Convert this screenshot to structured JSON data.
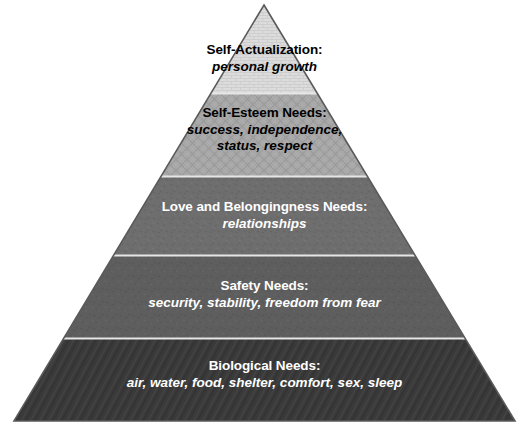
{
  "diagram": {
    "type": "pyramid",
    "name": "maslow-hierarchy-of-needs",
    "background_color": "#ffffff",
    "apex": {
      "x": 264,
      "y": 5
    },
    "base_left": {
      "x": 14,
      "y": 421
    },
    "base_right": {
      "x": 515,
      "y": 421
    },
    "divider_color": "#e8e8e8",
    "outline_color": "#555555",
    "tiers": [
      {
        "id": "self-actualization",
        "order": 1,
        "title": "Self-Actualization:",
        "description": "personal growth",
        "fill_color": "#dcdcdc",
        "text_color": "#000000",
        "texture": "brick",
        "top_y": 5,
        "bottom_y": 93
      },
      {
        "id": "self-esteem",
        "order": 2,
        "title": "Self-Esteem Needs:",
        "description": "success, independence,\nstatus, respect",
        "description_line_1": "success, independence,",
        "description_line_2": "status, respect",
        "fill_color": "#a8a8a8",
        "text_color": "#000000",
        "texture": "diamond-lattice",
        "top_y": 93,
        "bottom_y": 176
      },
      {
        "id": "love-and-belongingness",
        "order": 3,
        "title": "Love and Belongingness Needs:",
        "description": "relationships",
        "fill_color": "#6e6e6e",
        "text_color": "#ffffff",
        "texture": "speckle",
        "top_y": 176,
        "bottom_y": 255
      },
      {
        "id": "safety",
        "order": 4,
        "title": "Safety Needs:",
        "description": "security, stability, freedom from fear",
        "fill_color": "#5e5e5e",
        "text_color": "#ffffff",
        "texture": "speckle",
        "top_y": 255,
        "bottom_y": 338
      },
      {
        "id": "biological",
        "order": 5,
        "title": "Biological Needs:",
        "description": "air, water, food, shelter, comfort, sex, sleep",
        "fill_color": "#3a3a3a",
        "text_color": "#ffffff",
        "texture": "diagonal-hatch",
        "top_y": 338,
        "bottom_y": 421
      }
    ]
  }
}
